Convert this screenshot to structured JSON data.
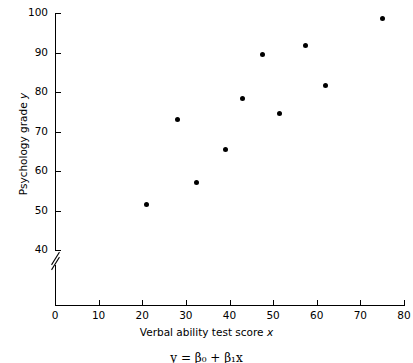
{
  "chart_data": {
    "type": "scatter",
    "title": "",
    "xlabel": "Verbal ability test score x",
    "xlabel_plain": "Verbal ability test score",
    "xlabel_var": "x",
    "ylabel": "Psychology grade y",
    "ylabel_plain": "Psychology grade",
    "ylabel_var": "y",
    "xlim": [
      0,
      80
    ],
    "ylim": [
      40,
      100
    ],
    "y_axis_break": true,
    "y_axis_break_note": "axis break between 0 and 40",
    "grid": false,
    "legend": null,
    "xticks": [
      0,
      10,
      20,
      30,
      40,
      50,
      60,
      70,
      80
    ],
    "yticks": [
      40,
      50,
      60,
      70,
      80,
      90,
      100
    ],
    "x": [
      21,
      28,
      32.5,
      39,
      43,
      47.5,
      51.5,
      57.5,
      62,
      75
    ],
    "y": [
      51.5,
      73,
      57,
      65.5,
      78.3,
      89.4,
      74.5,
      91.7,
      81.7,
      98.5
    ],
    "points": [
      {
        "x": 21,
        "y": 51.5
      },
      {
        "x": 28,
        "y": 73
      },
      {
        "x": 32.5,
        "y": 57
      },
      {
        "x": 39,
        "y": 65.5
      },
      {
        "x": 43,
        "y": 78.3
      },
      {
        "x": 47.5,
        "y": 89.4
      },
      {
        "x": 51.5,
        "y": 74.5
      },
      {
        "x": 57.5,
        "y": 91.7
      },
      {
        "x": 62,
        "y": 81.7
      },
      {
        "x": 75,
        "y": 98.5
      }
    ],
    "marker": {
      "shape": "circle",
      "color": "#000000",
      "size_px": 5
    },
    "caption_equation": "y = β₀ + β₁x"
  },
  "colors": {
    "background": "#ffffff",
    "axis": "#000000",
    "marker": "#000000",
    "text": "#000000"
  }
}
